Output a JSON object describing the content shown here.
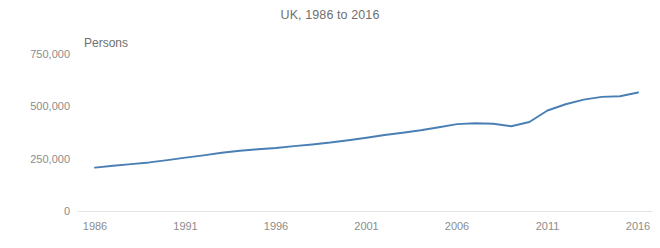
{
  "chart_data": {
    "type": "line",
    "title": "UK, 1986 to 2016",
    "subtitle": "",
    "xlabel": "",
    "ylabel": "Persons",
    "unit_label": "Persons",
    "xlim": [
      1986,
      2016
    ],
    "ylim": [
      0,
      750000
    ],
    "grid": false,
    "legend": false,
    "legend_position": "none",
    "line_color": "#4a7fb5",
    "x_tick_labels": [
      "1986",
      "1991",
      "1996",
      "2001",
      "2006",
      "2011",
      "2016"
    ],
    "x_ticks": [
      1986,
      1991,
      1996,
      2001,
      2006,
      2011,
      2016
    ],
    "y_tick_labels": [
      "750,000",
      "500,000",
      "250,000",
      "0"
    ],
    "y_ticks": [
      750000,
      500000,
      250000,
      0
    ],
    "series": [
      {
        "name": "Persons",
        "color": "#4a7fb5",
        "x": [
          1986,
          1987,
          1988,
          1989,
          1990,
          1991,
          1992,
          1993,
          1994,
          1995,
          1996,
          1997,
          1998,
          1999,
          2000,
          2001,
          2002,
          2003,
          2004,
          2005,
          2006,
          2007,
          2008,
          2009,
          2010,
          2011,
          2012,
          2013,
          2014,
          2015,
          2016
        ],
        "values": [
          207000,
          216000,
          224000,
          232000,
          243000,
          255000,
          266000,
          278000,
          288000,
          295000,
          301000,
          310000,
          318000,
          327000,
          338000,
          350000,
          363000,
          374000,
          386000,
          400000,
          415000,
          419000,
          417000,
          405000,
          425000,
          480000,
          510000,
          532000,
          545000,
          548000,
          566000
        ]
      }
    ]
  },
  "chart": {
    "title": "UK, 1986 to 2016",
    "unit_label": "Persons"
  }
}
